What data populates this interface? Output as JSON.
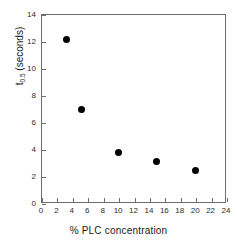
{
  "chart_data": {
    "type": "scatter",
    "title": "",
    "xlabel": "% PLC concentration",
    "ylabel": "t0.5  (seconds)",
    "ylabel_main": "t",
    "ylabel_sub": "0.5",
    "ylabel_tail": " (seconds)",
    "xlim": [
      0,
      24
    ],
    "ylim": [
      0,
      14
    ],
    "grid": false,
    "legend": null,
    "xticks": [
      0,
      2,
      4,
      6,
      8,
      10,
      12,
      14,
      16,
      18,
      20,
      22,
      24
    ],
    "xticklabels": [
      "0",
      "2",
      "4",
      "6",
      "8",
      "10",
      "12",
      "14",
      "16",
      "18",
      "20",
      "22",
      "24"
    ],
    "yticks": [
      0,
      2,
      4,
      6,
      8,
      10,
      12,
      14
    ],
    "yticklabels": [
      "0",
      "2",
      "4",
      "6",
      "8",
      "10",
      "12",
      "14"
    ],
    "marker": "filled-circle",
    "marker_color": "#000000",
    "marker_size_px": 7,
    "x": [
      3.3,
      5.3,
      10.1,
      15.0,
      20.0
    ],
    "y": [
      12.1,
      6.9,
      3.75,
      3.05,
      2.4
    ],
    "points": [
      {
        "x": 3.3,
        "y": 12.1
      },
      {
        "x": 5.3,
        "y": 6.9
      },
      {
        "x": 10.1,
        "y": 3.75
      },
      {
        "x": 15.0,
        "y": 3.05
      },
      {
        "x": 20.0,
        "y": 2.4
      }
    ],
    "axis_color": "#6d6d6d",
    "background": "#ffffff"
  }
}
